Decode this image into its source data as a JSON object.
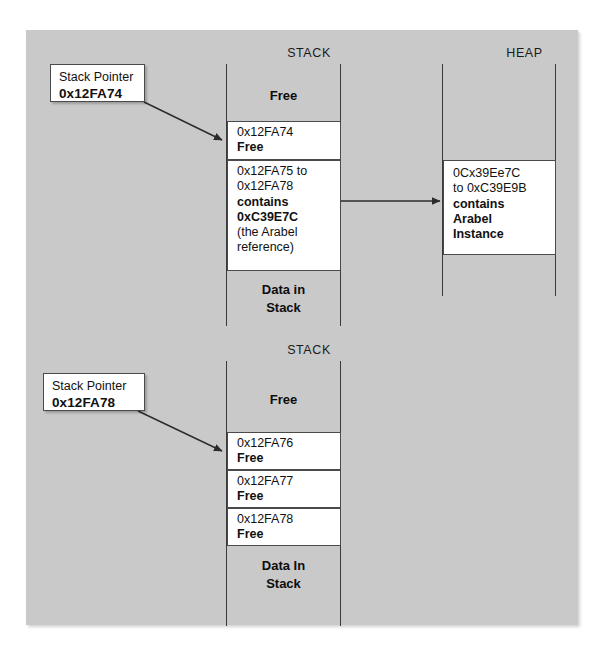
{
  "diagram": {
    "title_stack": "STACK",
    "title_heap": "HEAP",
    "upper": {
      "callout": {
        "line1": "Stack Pointer",
        "line2": "0x12FA74"
      },
      "stack_header": "STACK",
      "heap_header": "HEAP",
      "stack_cells": [
        {
          "type": "gray",
          "lines": [
            "Free"
          ]
        },
        {
          "type": "white",
          "lines": [
            "0x12FA74",
            "Free"
          ],
          "bold": [
            false,
            true
          ]
        },
        {
          "type": "white",
          "lines": [
            "0x12FA75 to",
            "0x12FA78",
            "contains",
            "0xC39E7C",
            "(the Arabel",
            "reference)"
          ],
          "bold": [
            false,
            false,
            true,
            true,
            false,
            false
          ]
        },
        {
          "type": "gray",
          "lines": [
            "Data in",
            "Stack"
          ]
        }
      ],
      "heap_cells": [
        {
          "type": "white",
          "lines": [
            "0Cx39Ee7C",
            "to 0xC39E9B",
            "contains",
            "Arabel",
            "Instance"
          ],
          "bold": [
            false,
            false,
            true,
            true,
            true
          ]
        }
      ]
    },
    "lower": {
      "callout": {
        "line1": "Stack Pointer",
        "line2": "0x12FA78"
      },
      "stack_header": "STACK",
      "stack_cells": [
        {
          "type": "gray",
          "lines": [
            "Free"
          ]
        },
        {
          "type": "white",
          "lines": [
            "0x12FA76",
            "Free"
          ],
          "bold": [
            false,
            true
          ]
        },
        {
          "type": "white",
          "lines": [
            "0x12FA77",
            "Free"
          ],
          "bold": [
            false,
            true
          ]
        },
        {
          "type": "white",
          "lines": [
            "0x12FA78",
            "Free"
          ],
          "bold": [
            false,
            true
          ]
        },
        {
          "type": "gray",
          "lines": [
            "Data In",
            "Stack"
          ]
        }
      ]
    },
    "labels": {
      "upper_free": "Free",
      "upper_addr_1": "0x12FA74",
      "upper_addr_1_state": "Free",
      "upper_range_l1": "0x12FA75 to",
      "upper_range_l2": "0x12FA78",
      "upper_range_l3": "contains",
      "upper_range_l4": "0xC39E7C",
      "upper_range_l5": "(the Arabel",
      "upper_range_l6": "reference)",
      "upper_data_l1": "Data in",
      "upper_data_l2": "Stack",
      "heap_l1": "0Cx39Ee7C",
      "heap_l2": "to 0xC39E9B",
      "heap_l3": "contains",
      "heap_l4": "Arabel",
      "heap_l5": "Instance",
      "lower_free": "Free",
      "lower_addr_1": "0x12FA76",
      "lower_addr_1_state": "Free",
      "lower_addr_2": "0x12FA77",
      "lower_addr_2_state": "Free",
      "lower_addr_3": "0x12FA78",
      "lower_addr_3_state": "Free",
      "lower_data_l1": "Data In",
      "lower_data_l2": "Stack"
    },
    "colors": {
      "panel_background": "#c9c9c9",
      "box_fill": "#ffffff",
      "line": "#3a3a3a",
      "text": "#111111"
    },
    "arrows": [
      {
        "name": "stack-pointer-arrow-upper",
        "from": "upper callout",
        "to": "0x12FA74 cell"
      },
      {
        "name": "stack-to-heap-arrow",
        "from": "0x12FA75 to 0x12FA78 cell",
        "to": "heap Arabel Instance cell"
      },
      {
        "name": "stack-pointer-arrow-lower",
        "from": "lower callout",
        "to": "0x12FA76 cell"
      }
    ]
  }
}
